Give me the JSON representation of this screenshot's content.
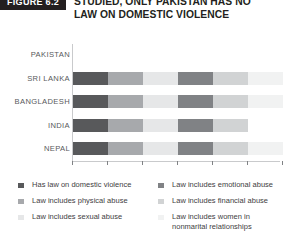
{
  "figure": {
    "tag": "FIGURE 6.2",
    "title_lines": [
      "STUDIED, ONLY PAKISTAN HAS NO",
      "LAW ON DOMESTIC VIOLENCE"
    ]
  },
  "colors": {
    "series": [
      "#58595b",
      "#a7a9ac",
      "#e6e7e8",
      "#808285",
      "#d1d3d4",
      "#f1f2f2"
    ],
    "axis": "#c9cacc",
    "tick": "#808285",
    "label": "#58595b",
    "legend_text": "#414042",
    "tag_bg": "#231f20",
    "tag_text": "#ffffff",
    "title_text": "#231f20"
  },
  "legend": {
    "columns": [
      {
        "items": [
          {
            "label": "Has law on domestic violence",
            "color": "#58595b"
          },
          {
            "label": "Law includes physical abuse",
            "color": "#a7a9ac"
          },
          {
            "label": "Law includes sexual abuse",
            "color": "#e6e7e8"
          }
        ]
      },
      {
        "items": [
          {
            "label": "Law includes emotional abuse",
            "color": "#808285"
          },
          {
            "label": "Law includes financial abuse",
            "color": "#d1d3d4"
          },
          {
            "label": "Law includes women in nonmarital relationships",
            "color": "#f1f2f2"
          }
        ]
      }
    ]
  },
  "chart_data": {
    "type": "bar",
    "orientation": "horizontal",
    "stacked": true,
    "title": "STUDIED, ONLY PAKISTAN HAS NO LAW ON DOMESTIC VIOLENCE",
    "xlabel": "",
    "ylabel": "",
    "grid": false,
    "legend_position": "bottom",
    "axis_ticks": 7,
    "axis_tick_labels": [],
    "xlim": [
      0,
      6
    ],
    "categories": [
      "PAKISTAN",
      "SRI LANKA",
      "BANGLADESH",
      "INDIA",
      "NEPAL"
    ],
    "series": [
      {
        "name": "Has law on domestic violence",
        "color": "#58595b",
        "values": [
          0,
          1,
          1,
          1,
          1
        ]
      },
      {
        "name": "Law includes physical abuse",
        "color": "#a7a9ac",
        "values": [
          0,
          1,
          1,
          1,
          1
        ]
      },
      {
        "name": "Law includes sexual abuse",
        "color": "#e6e7e8",
        "values": [
          0,
          1,
          1,
          1,
          1
        ]
      },
      {
        "name": "Law includes emotional abuse",
        "color": "#808285",
        "values": [
          0,
          1,
          1,
          1,
          1
        ]
      },
      {
        "name": "Law includes financial abuse",
        "color": "#d1d3d4",
        "values": [
          0,
          1,
          1,
          1,
          1
        ]
      },
      {
        "name": "Law includes women in nonmarital relationships",
        "color": "#f1f2f2",
        "values": [
          0,
          1,
          1,
          0,
          1
        ]
      }
    ],
    "totals": [
      0,
      5,
      6,
      5,
      6
    ]
  }
}
